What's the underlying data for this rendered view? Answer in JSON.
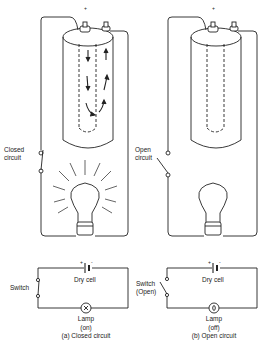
{
  "figure": {
    "panel_a": {
      "top_label": [
        "Closed",
        "circuit"
      ],
      "schematic": {
        "switch_label": "Switch",
        "cell_label": "Dry cell",
        "cell_plus": "+",
        "cell_minus": "-",
        "lamp_label": "Lamp",
        "lamp_state": "(on)",
        "caption": "(a) Closed circuit"
      }
    },
    "panel_b": {
      "top_label": [
        "Open",
        "circuit"
      ],
      "schematic": {
        "switch_label": "Switch",
        "switch_state": "(Open)",
        "cell_label": "Dry cell",
        "cell_plus": "+",
        "cell_minus": "-",
        "lamp_label": "Lamp",
        "lamp_state": "(off)",
        "caption": "(b) Open circuit"
      }
    },
    "colors": {
      "line": "#222222",
      "background": "#ffffff"
    }
  }
}
